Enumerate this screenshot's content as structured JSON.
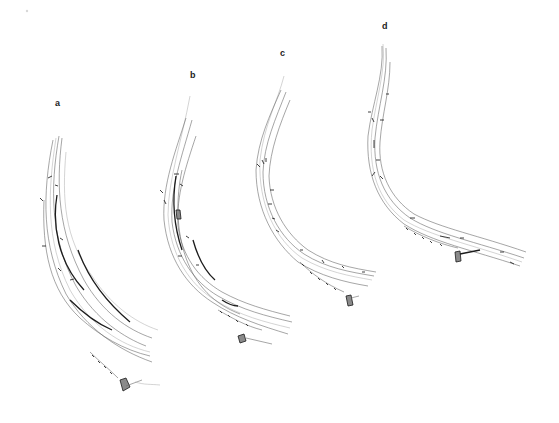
{
  "figure": {
    "panels": [
      {
        "id": "a",
        "label": "a"
      },
      {
        "id": "b",
        "label": "b"
      },
      {
        "id": "c",
        "label": "c"
      },
      {
        "id": "d",
        "label": "d"
      }
    ],
    "colors": {
      "background": "#ffffff",
      "line": "#6a6a6a",
      "dark_line": "#1c1c1c"
    }
  }
}
